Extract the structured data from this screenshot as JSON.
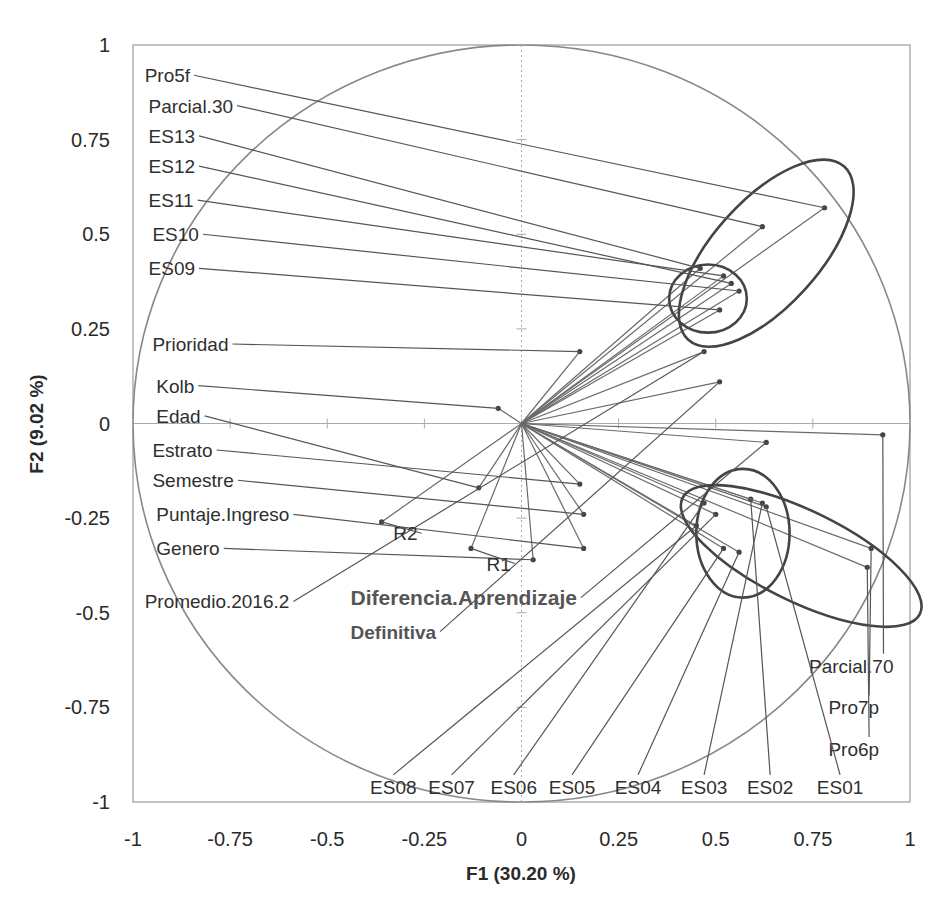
{
  "chart_data": {
    "type": "scatter",
    "subtype": "pca-correlation-circle",
    "title": "",
    "xlabel": "F1 (30.20 %)",
    "ylabel": "F2 (9.02 %)",
    "xlim": [
      -1,
      1
    ],
    "ylim": [
      -1,
      1
    ],
    "x_ticks": [
      "-1",
      "-0.75",
      "-0.5",
      "-0.25",
      "0",
      "0.25",
      "0.5",
      "0.75",
      "1"
    ],
    "y_ticks": [
      "1",
      "0.75",
      "0.5",
      "0.25",
      "0",
      "-0.25",
      "-0.5",
      "-0.75",
      "-1"
    ],
    "grid": false,
    "unit_circle": true,
    "variables": [
      {
        "name": "Pro5f",
        "x": 0.78,
        "y": 0.57,
        "label_x": -0.97,
        "label_y": 0.92
      },
      {
        "name": "Parcial.30",
        "x": 0.62,
        "y": 0.52,
        "label_x": -0.96,
        "label_y": 0.84
      },
      {
        "name": "ES13",
        "x": 0.46,
        "y": 0.41,
        "label_x": -0.96,
        "label_y": 0.76
      },
      {
        "name": "ES12",
        "x": 0.54,
        "y": 0.37,
        "label_x": -0.96,
        "label_y": 0.68
      },
      {
        "name": "ES11",
        "x": 0.52,
        "y": 0.39,
        "label_x": -0.96,
        "label_y": 0.59
      },
      {
        "name": "ES10",
        "x": 0.56,
        "y": 0.35,
        "label_x": -0.95,
        "label_y": 0.5
      },
      {
        "name": "ES09",
        "x": 0.51,
        "y": 0.3,
        "label_x": -0.96,
        "label_y": 0.41
      },
      {
        "name": "Prioridad",
        "x": 0.15,
        "y": 0.19,
        "label_x": -0.95,
        "label_y": 0.21
      },
      {
        "name": "Kolb",
        "x": -0.06,
        "y": 0.04,
        "label_x": -0.94,
        "label_y": 0.1
      },
      {
        "name": "Edad",
        "x": -0.11,
        "y": -0.17,
        "label_x": -0.94,
        "label_y": 0.02
      },
      {
        "name": "Estrato",
        "x": 0.15,
        "y": -0.16,
        "label_x": -0.95,
        "label_y": -0.07
      },
      {
        "name": "Semestre",
        "x": 0.16,
        "y": -0.24,
        "label_x": -0.95,
        "label_y": -0.15
      },
      {
        "name": "Puntaje.Ingreso",
        "x": 0.16,
        "y": -0.33,
        "label_x": -0.94,
        "label_y": -0.24
      },
      {
        "name": "Genero",
        "x": 0.03,
        "y": -0.36,
        "label_x": -0.94,
        "label_y": -0.33
      },
      {
        "name": "Promedio.2016.2",
        "x": 0.47,
        "y": 0.19,
        "label_x": -0.97,
        "label_y": -0.47
      },
      {
        "name": "Diferencia.Aprendizaje",
        "x": 0.63,
        "y": -0.05,
        "label_x": -0.44,
        "label_y": -0.46
      },
      {
        "name": "Definitiva",
        "x": 0.51,
        "y": 0.11,
        "label_x": -0.44,
        "label_y": -0.55
      },
      {
        "name": "R1",
        "x": -0.13,
        "y": -0.33,
        "label_x": -0.09,
        "label_y": -0.37
      },
      {
        "name": "R2",
        "x": -0.36,
        "y": -0.26,
        "label_x": -0.33,
        "label_y": -0.29
      },
      {
        "name": "Parcial.70",
        "x": 0.93,
        "y": -0.03,
        "label_x": 0.74,
        "label_y": -0.64
      },
      {
        "name": "Pro7p",
        "x": 0.9,
        "y": -0.33,
        "label_x": 0.79,
        "label_y": -0.75
      },
      {
        "name": "Pro6p",
        "x": 0.89,
        "y": -0.38,
        "label_x": 0.79,
        "label_y": -0.86
      },
      {
        "name": "ES01",
        "x": 0.63,
        "y": -0.22,
        "label_x": 0.82,
        "label_y": -0.96
      },
      {
        "name": "ES02",
        "x": 0.59,
        "y": -0.2,
        "label_x": 0.64,
        "label_y": -0.96
      },
      {
        "name": "ES03",
        "x": 0.62,
        "y": -0.21,
        "label_x": 0.47,
        "label_y": -0.96
      },
      {
        "name": "ES04",
        "x": 0.56,
        "y": -0.34,
        "label_x": 0.3,
        "label_y": -0.96
      },
      {
        "name": "ES05",
        "x": 0.52,
        "y": -0.33,
        "label_x": 0.13,
        "label_y": -0.96
      },
      {
        "name": "ES06",
        "x": 0.47,
        "y": -0.21,
        "label_x": -0.02,
        "label_y": -0.96
      },
      {
        "name": "ES07",
        "x": 0.5,
        "y": -0.24,
        "label_x": -0.18,
        "label_y": -0.96
      },
      {
        "name": "ES08",
        "x": 0.45,
        "y": -0.27,
        "label_x": -0.33,
        "label_y": -0.96
      }
    ],
    "annotations": [
      {
        "type": "ellipse",
        "cx": 0.63,
        "cy": 0.45,
        "rx": 0.3,
        "ry": 0.14,
        "rotate": -48,
        "note": "upper cluster large ellipse"
      },
      {
        "type": "ellipse",
        "cx": 0.48,
        "cy": 0.33,
        "rx": 0.1,
        "ry": 0.09,
        "rotate": 0,
        "note": "upper cluster small circle"
      },
      {
        "type": "ellipse",
        "cx": 0.72,
        "cy": -0.35,
        "rx": 0.34,
        "ry": 0.12,
        "rotate": 26,
        "note": "lower cluster large ellipse"
      },
      {
        "type": "ellipse",
        "cx": 0.57,
        "cy": -0.29,
        "rx": 0.12,
        "ry": 0.17,
        "rotate": 0,
        "note": "lower cluster circle"
      }
    ]
  }
}
